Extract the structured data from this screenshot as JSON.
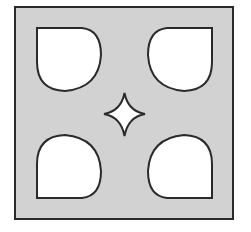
{
  "diagram": {
    "colors": {
      "background": "#ffffff",
      "tile_fill": "#d2d2d2",
      "cutout_fill": "#ffffff",
      "stroke": "#2a2a2a"
    },
    "tile": {
      "x": 15,
      "y": 7,
      "width": 218,
      "height": 212
    },
    "cutouts": [
      {
        "position": "top-left"
      },
      {
        "position": "top-right"
      },
      {
        "position": "bottom-left"
      },
      {
        "position": "bottom-right"
      }
    ],
    "center_shape": "four-pointed-star"
  }
}
